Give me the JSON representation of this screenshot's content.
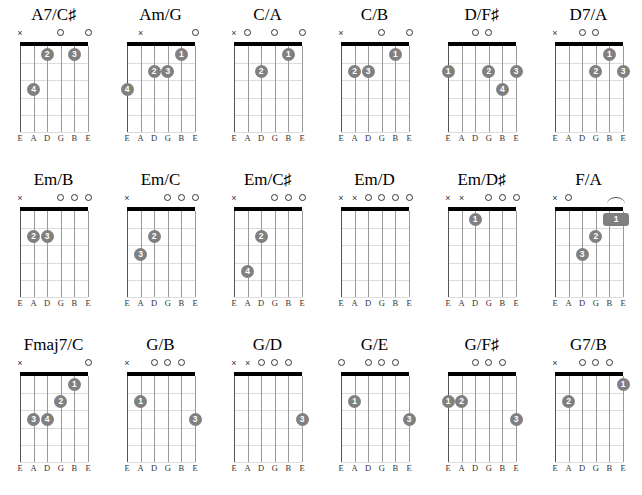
{
  "page": {
    "kind": "guitar-chord-chart",
    "rows": 3,
    "columns": 6,
    "string_labels": [
      "E",
      "A",
      "D",
      "G",
      "B",
      "E"
    ],
    "frets": 5,
    "dot_color": "#808080",
    "dot_text_color": "#ffffff",
    "nut_color": "#000000",
    "fret_color": "#dcdcdc",
    "string_color": "#9a9a9a",
    "background": "#ffffff",
    "marker_open": "o",
    "marker_muted": "×"
  },
  "chords": [
    {
      "name": "A7/C♯",
      "label_main": "A7/C",
      "label_sharp": "♯",
      "markers": [
        "x",
        "",
        "",
        "o",
        "",
        "o"
      ],
      "dots": [
        {
          "string": 3,
          "fret": 1,
          "finger": "2"
        },
        {
          "string": 5,
          "fret": 1,
          "finger": "3"
        },
        {
          "string": 2,
          "fret": 3,
          "finger": "4"
        }
      ],
      "barres": []
    },
    {
      "name": "Am/G",
      "label_main": "Am/G",
      "label_sharp": "",
      "markers": [
        "",
        "x",
        "",
        "",
        "",
        "o"
      ],
      "dots": [
        {
          "string": 5,
          "fret": 1,
          "finger": "1"
        },
        {
          "string": 3,
          "fret": 2,
          "finger": "2"
        },
        {
          "string": 4,
          "fret": 2,
          "finger": "3"
        },
        {
          "string": 1,
          "fret": 3,
          "finger": "4"
        }
      ],
      "barres": []
    },
    {
      "name": "C/A",
      "label_main": "C/A",
      "label_sharp": "",
      "markers": [
        "x",
        "o",
        "",
        "o",
        "",
        "o"
      ],
      "dots": [
        {
          "string": 5,
          "fret": 1,
          "finger": "1"
        },
        {
          "string": 3,
          "fret": 2,
          "finger": "2"
        }
      ],
      "barres": []
    },
    {
      "name": "C/B",
      "label_main": "C/B",
      "label_sharp": "",
      "markers": [
        "x",
        "",
        "",
        "o",
        "",
        "o"
      ],
      "dots": [
        {
          "string": 5,
          "fret": 1,
          "finger": "1"
        },
        {
          "string": 2,
          "fret": 2,
          "finger": "2"
        },
        {
          "string": 3,
          "fret": 2,
          "finger": "3"
        }
      ],
      "barres": []
    },
    {
      "name": "D/F♯",
      "label_main": "D/F",
      "label_sharp": "♯",
      "markers": [
        "",
        "",
        "o",
        "o",
        "",
        ""
      ],
      "dots": [
        {
          "string": 1,
          "fret": 2,
          "finger": "1"
        },
        {
          "string": 4,
          "fret": 2,
          "finger": "2"
        },
        {
          "string": 6,
          "fret": 2,
          "finger": "3"
        },
        {
          "string": 5,
          "fret": 3,
          "finger": "4"
        }
      ],
      "barres": []
    },
    {
      "name": "D7/A",
      "label_main": "D7/A",
      "label_sharp": "",
      "markers": [
        "x",
        "",
        "o",
        "o",
        "",
        ""
      ],
      "dots": [
        {
          "string": 5,
          "fret": 1,
          "finger": "1"
        },
        {
          "string": 4,
          "fret": 2,
          "finger": "2"
        },
        {
          "string": 6,
          "fret": 2,
          "finger": "3"
        }
      ],
      "barres": []
    },
    {
      "name": "Em/B",
      "label_main": "Em/B",
      "label_sharp": "",
      "markers": [
        "x",
        "",
        "",
        "o",
        "o",
        "o"
      ],
      "dots": [
        {
          "string": 2,
          "fret": 2,
          "finger": "2"
        },
        {
          "string": 3,
          "fret": 2,
          "finger": "3"
        }
      ],
      "barres": []
    },
    {
      "name": "Em/C",
      "label_main": "Em/C",
      "label_sharp": "",
      "markers": [
        "x",
        "",
        "",
        "o",
        "o",
        "o"
      ],
      "dots": [
        {
          "string": 3,
          "fret": 2,
          "finger": "2"
        },
        {
          "string": 2,
          "fret": 3,
          "finger": "3"
        }
      ],
      "barres": []
    },
    {
      "name": "Em/C♯",
      "label_main": "Em/C",
      "label_sharp": "♯",
      "markers": [
        "x",
        "",
        "",
        "o",
        "o",
        "o"
      ],
      "dots": [
        {
          "string": 3,
          "fret": 2,
          "finger": "2"
        },
        {
          "string": 2,
          "fret": 4,
          "finger": "4"
        }
      ],
      "barres": []
    },
    {
      "name": "Em/D",
      "label_main": "Em/D",
      "label_sharp": "",
      "markers": [
        "x",
        "x",
        "o",
        "o",
        "o",
        "o"
      ],
      "dots": [],
      "barres": []
    },
    {
      "name": "Em/D♯",
      "label_main": "Em/D",
      "label_sharp": "♯",
      "markers": [
        "x",
        "x",
        "",
        "o",
        "o",
        "o"
      ],
      "dots": [
        {
          "string": 3,
          "fret": 1,
          "finger": "1"
        }
      ],
      "barres": []
    },
    {
      "name": "F/A",
      "label_main": "F/A",
      "label_sharp": "",
      "markers": [
        "x",
        "o",
        "",
        "",
        "",
        ""
      ],
      "dots": [
        {
          "string": 4,
          "fret": 2,
          "finger": "2"
        },
        {
          "string": 3,
          "fret": 3,
          "finger": "3"
        }
      ],
      "barres": [
        {
          "from_string": 5,
          "to_string": 6,
          "fret": 1,
          "finger": "1"
        }
      ]
    },
    {
      "name": "Fmaj7/C",
      "label_main": "Fmaj7/C",
      "label_sharp": "",
      "markers": [
        "x",
        "",
        "",
        "",
        "",
        "o"
      ],
      "dots": [
        {
          "string": 5,
          "fret": 1,
          "finger": "1"
        },
        {
          "string": 4,
          "fret": 2,
          "finger": "2"
        },
        {
          "string": 2,
          "fret": 3,
          "finger": "3"
        },
        {
          "string": 3,
          "fret": 3,
          "finger": "4"
        }
      ],
      "barres": []
    },
    {
      "name": "G/B",
      "label_main": "G/B",
      "label_sharp": "",
      "markers": [
        "x",
        "",
        "o",
        "o",
        "o",
        ""
      ],
      "dots": [
        {
          "string": 2,
          "fret": 2,
          "finger": "1"
        },
        {
          "string": 6,
          "fret": 3,
          "finger": "3"
        }
      ],
      "barres": []
    },
    {
      "name": "G/D",
      "label_main": "G/D",
      "label_sharp": "",
      "markers": [
        "x",
        "x",
        "o",
        "o",
        "o",
        ""
      ],
      "dots": [
        {
          "string": 6,
          "fret": 3,
          "finger": "3"
        }
      ],
      "barres": []
    },
    {
      "name": "G/E",
      "label_main": "G/E",
      "label_sharp": "",
      "markers": [
        "o",
        "",
        "o",
        "o",
        "o",
        ""
      ],
      "dots": [
        {
          "string": 2,
          "fret": 2,
          "finger": "1"
        },
        {
          "string": 6,
          "fret": 3,
          "finger": "3"
        }
      ],
      "barres": []
    },
    {
      "name": "G/F♯",
      "label_main": "G/F",
      "label_sharp": "♯",
      "markers": [
        "",
        "",
        "o",
        "o",
        "o",
        ""
      ],
      "dots": [
        {
          "string": 1,
          "fret": 2,
          "finger": "1"
        },
        {
          "string": 2,
          "fret": 2,
          "finger": "2"
        },
        {
          "string": 6,
          "fret": 3,
          "finger": "3"
        }
      ],
      "barres": []
    },
    {
      "name": "G7/B",
      "label_main": "G7/B",
      "label_sharp": "",
      "markers": [
        "x",
        "",
        "o",
        "o",
        "o",
        ""
      ],
      "dots": [
        {
          "string": 6,
          "fret": 1,
          "finger": "1"
        },
        {
          "string": 2,
          "fret": 2,
          "finger": "2"
        }
      ],
      "barres": []
    }
  ]
}
